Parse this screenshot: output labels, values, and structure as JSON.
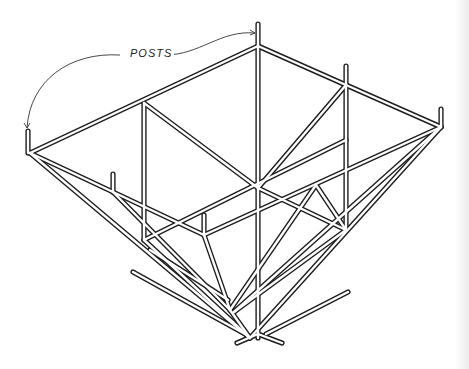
{
  "figure": {
    "annotation": {
      "label": "POSTS",
      "points_to": [
        "top post",
        "left corner post"
      ]
    },
    "colors": {
      "line": "#1e1e1e",
      "background": "#ffffff"
    }
  }
}
